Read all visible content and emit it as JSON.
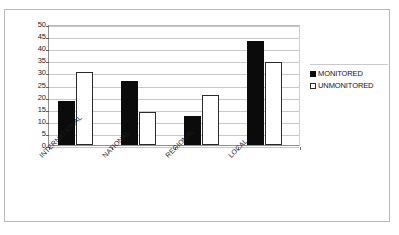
{
  "figure": {
    "title_remnant": "",
    "frame": true
  },
  "legend": {
    "position": "right",
    "entries": [
      {
        "label": "MONITORED",
        "swatch": "filled-square-icon",
        "color": "#0b0b0b"
      },
      {
        "label": "UNMONITORED",
        "swatch": "hollow-square-icon",
        "color": "#ffffff"
      }
    ]
  },
  "chart_data": {
    "type": "bar",
    "title": "",
    "xlabel": "",
    "ylabel": "",
    "ylim": [
      0,
      50
    ],
    "ytick_step": 5,
    "yticks": [
      0,
      5,
      10,
      15,
      20,
      25,
      30,
      35,
      40,
      45,
      50
    ],
    "ytick_labels": [
      "0",
      "5",
      "10",
      "15",
      "20",
      "25",
      "30",
      "35",
      "40",
      "45",
      "50"
    ],
    "grid": true,
    "grid_axis": "y",
    "legend_position": "right",
    "categories": [
      "INTERNATIONAL",
      "NATIONAL",
      "REGIONAL",
      "LOCAL"
    ],
    "series": [
      {
        "name": "MONITORED",
        "color": "#0b0b0b",
        "values": [
          18,
          26.5,
          12,
          43
        ]
      },
      {
        "name": "UNMONITORED",
        "color": "#ffffff",
        "values": [
          30,
          13.5,
          20.5,
          34.5
        ]
      }
    ]
  }
}
